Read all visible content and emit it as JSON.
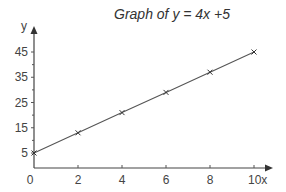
{
  "chart_data": {
    "type": "line",
    "title": "Graph of y = 4x +5",
    "xlabel": "x",
    "ylabel": "y",
    "xlim": [
      0,
      10
    ],
    "ylim": [
      0,
      47
    ],
    "x_ticks": [
      2,
      4,
      6,
      8,
      10
    ],
    "x_tick_labels": [
      "2",
      "4",
      "6",
      "8",
      "10"
    ],
    "origin_label": "0",
    "y_ticks_minor": [
      10,
      20,
      30,
      40
    ],
    "y_ticks": [
      5,
      15,
      25,
      35,
      45
    ],
    "y_tick_labels": [
      "5",
      "15",
      "25",
      "35",
      "45"
    ],
    "grid": false,
    "series": [
      {
        "name": "y = 4x + 5",
        "marker": "x",
        "x": [
          0,
          2,
          4,
          6,
          8,
          10
        ],
        "y": [
          5,
          13,
          21,
          29,
          37,
          45
        ]
      }
    ],
    "colors": {
      "line": "#555555",
      "axis": "#444444",
      "text": "#444444"
    }
  }
}
